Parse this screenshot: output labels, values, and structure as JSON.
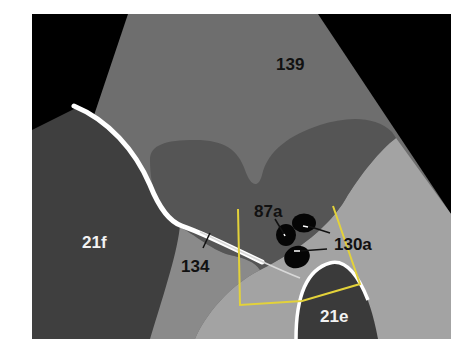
{
  "figure": {
    "type": "ultrasound-schematic",
    "colors": {
      "background": "#ffffff",
      "frame_black": "#000000",
      "region_139": "#6e6e6e",
      "region_21f": "#3f3f3f",
      "region_bilobed": "#555555",
      "region_right_light": "#a3a3a3",
      "region_lower_mid": "#8a8a8a",
      "region_21e": "#3a3a3a",
      "boundary_white": "#ffffff",
      "roi_outline_yellow": "#e3d23a",
      "blob_black": "#050505",
      "label_dark": "#111111",
      "label_light": "#f2f2f2"
    },
    "labels": {
      "l139": "139",
      "l21f": "21f",
      "l134": "134",
      "l87a": "87a",
      "l130a": "130a",
      "l21e": "21e"
    }
  }
}
